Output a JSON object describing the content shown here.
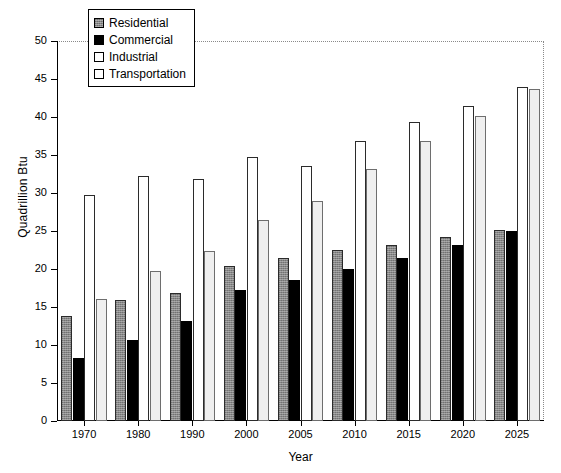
{
  "chart_data": {
    "type": "bar",
    "title": "",
    "xlabel": "Year",
    "ylabel": "Quadrillion Btu",
    "categories": [
      "1970",
      "1980",
      "1990",
      "2000",
      "2005",
      "2010",
      "2015",
      "2020",
      "2025"
    ],
    "ylim": [
      0,
      50
    ],
    "yticks": [
      0,
      5,
      10,
      15,
      20,
      25,
      30,
      35,
      40,
      45,
      50
    ],
    "ytick_labels": [
      "0",
      "5",
      "10",
      "15",
      "20",
      "25",
      "30",
      "35",
      "40",
      "45",
      "50"
    ],
    "grid": false,
    "legend_position": "top-left",
    "series": [
      {
        "name": "Residential",
        "color": "#878787",
        "values": [
          13.8,
          15.9,
          16.9,
          20.4,
          21.5,
          22.5,
          23.1,
          24.2,
          25.1
        ]
      },
      {
        "name": "Commercial",
        "color": "#000000",
        "values": [
          8.3,
          10.6,
          13.1,
          17.2,
          18.5,
          20.0,
          21.5,
          23.1,
          25.0
        ]
      },
      {
        "name": "Industrial",
        "color": "#ffffff",
        "values": [
          29.7,
          32.2,
          31.8,
          34.8,
          33.6,
          36.8,
          39.3,
          41.4,
          44.0
        ]
      },
      {
        "name": "Transportation",
        "color": "#efefef",
        "values": [
          16.1,
          19.7,
          22.4,
          26.5,
          28.9,
          33.1,
          36.9,
          40.1,
          43.7
        ]
      }
    ]
  }
}
